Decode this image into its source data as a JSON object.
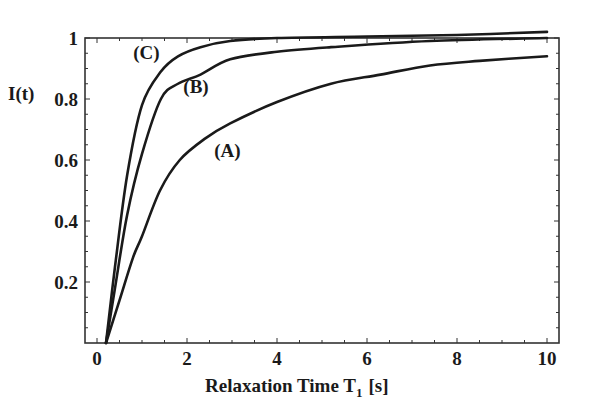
{
  "chart_data": {
    "type": "line",
    "title": "",
    "xlabel": "Relaxation Time T",
    "xlabel_subscript": "1",
    "xlabel_unit": "[s]",
    "ylabel": "I(t)",
    "xlim": [
      0,
      10.3
    ],
    "ylim": [
      0,
      1.0
    ],
    "xticks": [
      0,
      2,
      4,
      6,
      8,
      10
    ],
    "xtick_labels": [
      "0",
      "2",
      "4",
      "6",
      "8",
      "10"
    ],
    "yticks": [
      0.2,
      0.4,
      0.6,
      0.8,
      1
    ],
    "ytick_labels": [
      "0.2",
      "0.4",
      "0.6",
      "0.8",
      "1"
    ],
    "grid": false,
    "legend": "inline curve labels",
    "series": [
      {
        "name": "(A)",
        "x": [
          0.2,
          0.5,
          0.8,
          1.0,
          1.4,
          1.84,
          2.4,
          2.96,
          4.0,
          5.2,
          6.3,
          7.4,
          8.5,
          10.0
        ],
        "values": [
          0.0,
          0.14,
          0.28,
          0.35,
          0.5,
          0.6,
          0.67,
          0.72,
          0.79,
          0.85,
          0.88,
          0.91,
          0.925,
          0.94
        ]
      },
      {
        "name": "(B)",
        "x": [
          0.2,
          0.4,
          0.67,
          1.0,
          1.42,
          1.8,
          2.3,
          2.96,
          4.0,
          5.2,
          7.4,
          10.0
        ],
        "values": [
          0.0,
          0.18,
          0.42,
          0.62,
          0.8,
          0.85,
          0.88,
          0.93,
          0.955,
          0.97,
          0.99,
          1.0
        ]
      },
      {
        "name": "(C)",
        "x": [
          0.2,
          0.4,
          0.67,
          1.0,
          1.42,
          1.8,
          2.3,
          2.96,
          4.0,
          6.0,
          8.0,
          10.0
        ],
        "values": [
          0.0,
          0.25,
          0.55,
          0.78,
          0.89,
          0.94,
          0.97,
          0.99,
          1.0,
          1.005,
          1.01,
          1.02
        ]
      }
    ],
    "curve_label_positions": [
      {
        "name": "(A)",
        "x": 2.9,
        "y": 0.61
      },
      {
        "name": "(B)",
        "x": 2.2,
        "y": 0.82
      },
      {
        "name": "(C)",
        "x": 1.1,
        "y": 0.93
      }
    ]
  }
}
